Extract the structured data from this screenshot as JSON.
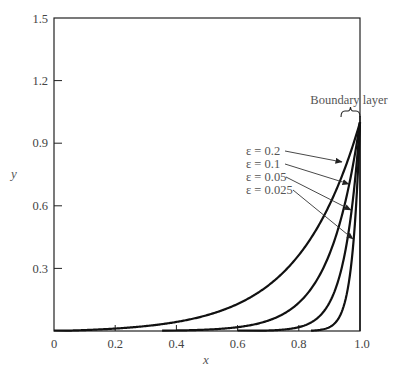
{
  "chart_data": {
    "type": "line",
    "title": "",
    "xlabel": "x",
    "ylabel": "y",
    "xlim": [
      0,
      1.0
    ],
    "ylim": [
      0,
      1.5
    ],
    "grid": false,
    "legend": "none (curves labeled by arrows)",
    "x_ticks": [
      "0",
      "0.2",
      "0.4",
      "0.6",
      "0.8",
      "1.0"
    ],
    "y_ticks": [
      "0.3",
      "0.6",
      "0.9",
      "1.2",
      "1.5"
    ],
    "formula_note": "curves approximate y = (exp(x/eps) - 1)/(exp(1/eps) - 1)",
    "series": [
      {
        "name": "ε = 0.2",
        "eps": 0.2,
        "x": [
          0,
          0.2,
          0.4,
          0.6,
          0.8,
          0.9,
          1.0
        ],
        "y": [
          0.0,
          0.01,
          0.04,
          0.13,
          0.37,
          0.61,
          1.0
        ]
      },
      {
        "name": "ε = 0.1",
        "eps": 0.1,
        "x": [
          0.4,
          0.6,
          0.8,
          0.9,
          0.95,
          1.0
        ],
        "y": [
          0.0,
          0.02,
          0.14,
          0.37,
          0.61,
          1.0
        ]
      },
      {
        "name": "ε = 0.05",
        "eps": 0.05,
        "x": [
          0.6,
          0.8,
          0.9,
          0.95,
          1.0
        ],
        "y": [
          0.0,
          0.02,
          0.14,
          0.37,
          1.0
        ]
      },
      {
        "name": "ε = 0.025",
        "eps": 0.025,
        "x": [
          0.85,
          0.9,
          0.95,
          0.975,
          1.0
        ],
        "y": [
          0.0,
          0.02,
          0.14,
          0.37,
          1.0
        ]
      }
    ],
    "annotations": [
      {
        "text": "Boundary layer",
        "target": "thin region near x = 1 (brace)"
      },
      {
        "text": "ε = 0.2",
        "arrow_to": "ε = 0.2 curve"
      },
      {
        "text": "ε = 0.1",
        "arrow_to": "ε = 0.1 curve"
      },
      {
        "text": "ε = 0.05",
        "arrow_to": "ε = 0.05 curve"
      },
      {
        "text": "ε = 0.025",
        "arrow_to": "ε = 0.025 curve"
      }
    ]
  },
  "labels": {
    "xlabel": "x",
    "ylabel": "y",
    "boundary_layer": "Boundary layer",
    "x_ticks": [
      "0",
      "0.2",
      "0.4",
      "0.6",
      "0.8",
      "1.0"
    ],
    "y_ticks": [
      "0.3",
      "0.6",
      "0.9",
      "1.2",
      "1.5"
    ],
    "curve_labels": [
      "ε = 0.2",
      "ε = 0.1",
      "ε = 0.05",
      "ε = 0.025"
    ]
  },
  "colors": {
    "curve": "#111111",
    "frame": "#222222",
    "text": "#444444",
    "arrow": "#333333"
  }
}
